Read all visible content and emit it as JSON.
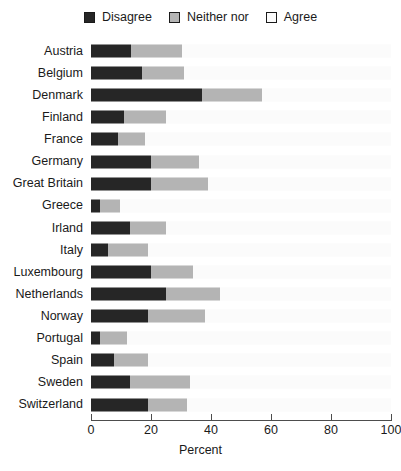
{
  "legend": {
    "position": "top-center",
    "entries": [
      {
        "label": "Disagree",
        "color": "#262626",
        "swatch": "filled-dark-square-icon"
      },
      {
        "label": "Neither nor",
        "color": "#b4b4b4",
        "swatch": "filled-gray-square-icon"
      },
      {
        "label": "Agree",
        "color": "#fbfbfb",
        "swatch": "empty-square-icon"
      }
    ]
  },
  "axis": {
    "title": "Percent",
    "ticks": [
      {
        "value": 0,
        "label": "0"
      },
      {
        "value": 20,
        "label": "20"
      },
      {
        "value": 40,
        "label": "40"
      },
      {
        "value": 60,
        "label": "60"
      },
      {
        "value": 80,
        "label": "80"
      },
      {
        "value": 100,
        "label": "100"
      }
    ]
  },
  "chart_data": {
    "type": "bar",
    "orientation": "horizontal",
    "stacked": true,
    "title": "",
    "subtitle": "",
    "xlabel": "Percent",
    "ylabel": "",
    "xlim": [
      0,
      100
    ],
    "grid": false,
    "legend_position": "top-center",
    "categories": [
      "Austria",
      "Belgium",
      "Denmark",
      "Finland",
      "France",
      "Germany",
      "Great Britain",
      "Greece",
      "Irland",
      "Italy",
      "Luxembourg",
      "Netherlands",
      "Norway",
      "Portugal",
      "Spain",
      "Sweden",
      "Switzerland"
    ],
    "series": [
      {
        "name": "Disagree",
        "color": "#262626",
        "values": [
          13.3,
          17.0,
          37.0,
          11.0,
          9.0,
          20.0,
          20.0,
          3.0,
          13.0,
          5.5,
          20.0,
          25.0,
          19.0,
          3.0,
          7.5,
          13.0,
          19.0
        ]
      },
      {
        "name": "Neither nor",
        "color": "#b4b4b4",
        "values": [
          17.0,
          14.0,
          20.0,
          14.0,
          9.0,
          16.0,
          19.0,
          6.5,
          12.0,
          13.5,
          14.0,
          18.0,
          19.0,
          9.0,
          11.5,
          20.0,
          13.0
        ]
      },
      {
        "name": "Agree",
        "color": "#fbfbfb",
        "values": [
          69.7,
          69.0,
          43.0,
          75.0,
          82.0,
          64.0,
          61.0,
          90.5,
          75.0,
          81.0,
          66.0,
          57.0,
          62.0,
          88.0,
          81.0,
          67.0,
          68.0
        ]
      }
    ]
  }
}
